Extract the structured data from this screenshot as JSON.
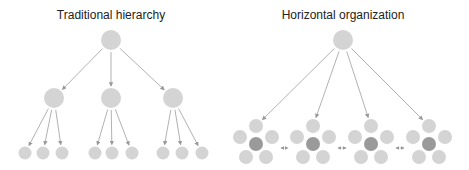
{
  "diagrams": [
    {
      "title": "Traditional hierarchy",
      "structure": {
        "root": "leader",
        "levels": 3,
        "children_per_manager": 3,
        "managers": 3
      }
    },
    {
      "title": "Horizontal organization",
      "structure": {
        "root": "leader",
        "teams": 4,
        "members_per_team": 5,
        "team_lead_highlighted": true,
        "peer_links_between_teams": 3
      }
    }
  ],
  "colors": {
    "node": "#d4d4d4",
    "highlight_node": "#9a9a9a",
    "edge": "#a8a8a8",
    "text": "#222222"
  }
}
